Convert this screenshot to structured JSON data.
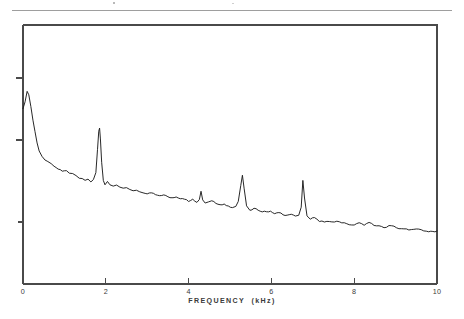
{
  "figure": {
    "background_color": "#ffffff",
    "ink_color": "#1c1c1c",
    "axis_color": "#4a4a4a",
    "top_rule_color": "#8d8d8d"
  },
  "chart_data": {
    "type": "line",
    "title": "",
    "subtitle": "",
    "xlabel": "FREQUENCY  (kHz)",
    "ylabel": "",
    "xlim": [
      0,
      10
    ],
    "ylim": [
      0,
      1
    ],
    "grid": false,
    "legend": null,
    "x_ticks": [
      0,
      2,
      4,
      6,
      8,
      10
    ],
    "x_tick_labels": [
      "0",
      "2",
      "4",
      "6",
      "8",
      "10"
    ],
    "y_ticks": [
      0.24,
      0.56,
      0.8
    ],
    "y_tick_labels": [
      "",
      "",
      ""
    ],
    "annotations": [],
    "series": [
      {
        "name": "spectrum",
        "x": [
          0.0,
          0.05,
          0.1,
          0.14,
          0.19,
          0.24,
          0.29,
          0.34,
          0.39,
          0.46,
          0.53,
          0.6,
          0.68,
          0.75,
          0.85,
          0.95,
          1.05,
          1.12,
          1.2,
          1.28,
          1.36,
          1.43,
          1.5,
          1.57,
          1.64,
          1.7,
          1.76,
          1.8,
          1.83,
          1.85,
          1.87,
          1.9,
          1.94,
          1.98,
          2.04,
          2.1,
          2.18,
          2.26,
          2.34,
          2.42,
          2.5,
          2.58,
          2.66,
          2.74,
          2.82,
          2.9,
          3.0,
          3.1,
          3.2,
          3.3,
          3.4,
          3.5,
          3.6,
          3.7,
          3.8,
          3.9,
          4.0,
          4.1,
          4.2,
          4.26,
          4.3,
          4.34,
          4.4,
          4.48,
          4.56,
          4.66,
          4.76,
          4.86,
          4.96,
          5.06,
          5.14,
          5.2,
          5.26,
          5.3,
          5.34,
          5.4,
          5.48,
          5.58,
          5.68,
          5.78,
          5.88,
          5.98,
          6.08,
          6.18,
          6.28,
          6.38,
          6.48,
          6.58,
          6.66,
          6.72,
          6.76,
          6.8,
          6.86,
          6.94,
          7.04,
          7.16,
          7.28,
          7.4,
          7.52,
          7.64,
          7.76,
          7.88,
          8.0,
          8.12,
          8.24,
          8.36,
          8.48,
          8.6,
          8.72,
          8.84,
          8.96,
          9.08,
          9.2,
          9.32,
          9.44,
          9.56,
          9.68,
          9.8,
          9.9,
          10.0
        ],
        "y": [
          0.675,
          0.7,
          0.74,
          0.726,
          0.69,
          0.636,
          0.586,
          0.545,
          0.515,
          0.492,
          0.478,
          0.47,
          0.462,
          0.455,
          0.448,
          0.441,
          0.434,
          0.43,
          0.425,
          0.419,
          0.413,
          0.409,
          0.405,
          0.4,
          0.397,
          0.4,
          0.43,
          0.52,
          0.59,
          0.602,
          0.56,
          0.47,
          0.4,
          0.383,
          0.396,
          0.383,
          0.378,
          0.382,
          0.374,
          0.37,
          0.372,
          0.365,
          0.36,
          0.362,
          0.356,
          0.352,
          0.348,
          0.352,
          0.345,
          0.341,
          0.344,
          0.337,
          0.333,
          0.336,
          0.329,
          0.325,
          0.322,
          0.326,
          0.32,
          0.33,
          0.358,
          0.33,
          0.316,
          0.312,
          0.316,
          0.308,
          0.304,
          0.307,
          0.3,
          0.297,
          0.3,
          0.32,
          0.38,
          0.42,
          0.37,
          0.3,
          0.285,
          0.288,
          0.282,
          0.279,
          0.282,
          0.276,
          0.272,
          0.275,
          0.269,
          0.266,
          0.269,
          0.263,
          0.262,
          0.3,
          0.4,
          0.33,
          0.258,
          0.25,
          0.252,
          0.246,
          0.243,
          0.246,
          0.24,
          0.237,
          0.24,
          0.234,
          0.231,
          0.233,
          0.228,
          0.238,
          0.23,
          0.224,
          0.221,
          0.223,
          0.218,
          0.215,
          0.217,
          0.212,
          0.21,
          0.212,
          0.207,
          0.205,
          0.203,
          0.202
        ],
        "peaks": [
          {
            "frequency_khz": 0.1,
            "label": "fundamental"
          },
          {
            "frequency_khz": 1.85,
            "label": "harmonic"
          },
          {
            "frequency_khz": 4.3,
            "label": "harmonic"
          },
          {
            "frequency_khz": 5.3,
            "label": "harmonic"
          },
          {
            "frequency_khz": 6.76,
            "label": "harmonic"
          }
        ]
      }
    ]
  }
}
